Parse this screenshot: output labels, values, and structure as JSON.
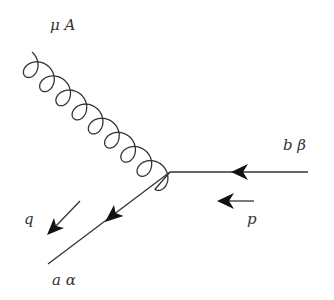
{
  "diagram": {
    "type": "feynman-diagram",
    "colors": {
      "line": "#333333",
      "background": "#ffffff"
    },
    "vertex": {
      "x": 170,
      "y": 172
    },
    "labels": {
      "gluon": "μ A",
      "incoming_quark": "b β",
      "outgoing_quark": "a α",
      "momentum_p": "p",
      "momentum_q": "q"
    },
    "edges": [
      {
        "name": "gluon",
        "style": "curly",
        "from": [
          32,
          52
        ],
        "to": [
          170,
          172
        ],
        "label": "μ A"
      },
      {
        "name": "incoming-fermion",
        "style": "solid-arrow",
        "from": [
          308,
          172
        ],
        "to": [
          170,
          172
        ],
        "label": "b β"
      },
      {
        "name": "outgoing-fermion",
        "style": "solid-arrow",
        "from": [
          170,
          172
        ],
        "to": [
          48,
          264
        ],
        "label": "a α"
      }
    ],
    "momentum_arrows": [
      {
        "label": "p",
        "from": [
          254,
          201
        ],
        "to": [
          217,
          201
        ]
      },
      {
        "label": "q",
        "from": [
          80,
          201
        ],
        "to": [
          47,
          235
        ]
      }
    ]
  }
}
